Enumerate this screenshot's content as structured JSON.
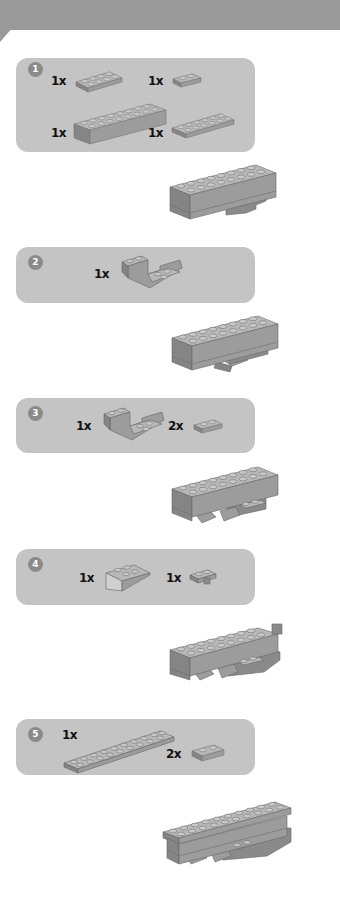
{
  "header": {
    "color": "#9a9a9a"
  },
  "colors": {
    "panel_bg": "#c4c4c4",
    "badge_bg": "#8a8a8a",
    "brick_top": "#b8b8b8",
    "brick_front": "#9c9c9c",
    "brick_side": "#858585",
    "stud": "#c8c8c8"
  },
  "steps": [
    {
      "number": "1",
      "parts": [
        {
          "qty": "1x",
          "part": "plate-2x4"
        },
        {
          "qty": "1x",
          "part": "plate-1x2"
        },
        {
          "qty": "1x",
          "part": "brick-2x8"
        },
        {
          "qty": "1x",
          "part": "plate-2x6"
        }
      ]
    },
    {
      "number": "2",
      "parts": [
        {
          "qty": "1x",
          "part": "slope-inverted-double-2x4"
        }
      ]
    },
    {
      "number": "3",
      "parts": [
        {
          "qty": "1x",
          "part": "slope-inverted-double-2x4"
        },
        {
          "qty": "2x",
          "part": "plate-1x2"
        }
      ]
    },
    {
      "number": "4",
      "parts": [
        {
          "qty": "1x",
          "part": "slope-inverted-2x3"
        },
        {
          "qty": "1x",
          "part": "plate-1x2-with-clip"
        }
      ]
    },
    {
      "number": "5",
      "parts": [
        {
          "qty": "1x",
          "part": "plate-1x10"
        },
        {
          "qty": "2x",
          "part": "plate-1x2"
        }
      ]
    }
  ]
}
